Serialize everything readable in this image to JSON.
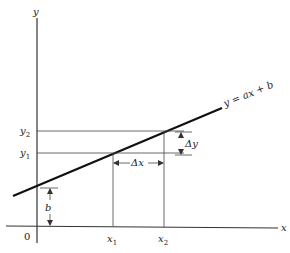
{
  "diagram": {
    "axes": {
      "x_label": "x",
      "y_label": "y",
      "origin_label": "0"
    },
    "line": {
      "equation": "y = ax + b",
      "color": "#111111"
    },
    "labels": {
      "x1_base": "x",
      "x1_sub": "1",
      "x2_base": "x",
      "x2_sub": "2",
      "y1_base": "y",
      "y1_sub": "1",
      "y2_base": "y",
      "y2_sub": "2",
      "b": "b",
      "delta_x": "Δx",
      "delta_y": "Δy"
    }
  }
}
